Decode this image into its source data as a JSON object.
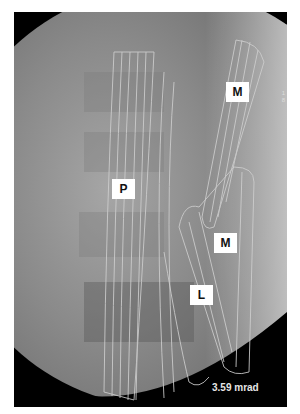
{
  "image": {
    "description": "Lateral fluoroscopy of lumbar spine with muscle fiber overlay",
    "labels": {
      "p": "P",
      "m_upper": "M",
      "m_lower": "M",
      "l": "L"
    },
    "corner_text": [
      "1",
      "8"
    ],
    "dose": "3.59 mrad",
    "colors": {
      "background": "#000000",
      "field_light": "#d9d9d9",
      "field_dark": "#6e6e6e",
      "overlay_lines": "#c8c8c8",
      "label_bg": "#ffffff"
    }
  }
}
